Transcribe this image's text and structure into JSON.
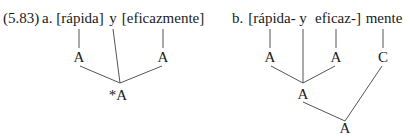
{
  "example_number": "(5.83)",
  "tree_a": {
    "label": "a.",
    "words": [
      "[rápida]",
      "y",
      "[eficazmente]"
    ],
    "nodes": {
      "left": "A",
      "right": "A",
      "root": "*A"
    }
  },
  "tree_b": {
    "label": "b.",
    "words": [
      "[rápida-",
      "y",
      "eficaz-]",
      "mente"
    ],
    "nodes": {
      "left": "A",
      "mid": "A",
      "c": "C",
      "coord": "A",
      "root": "A"
    }
  }
}
